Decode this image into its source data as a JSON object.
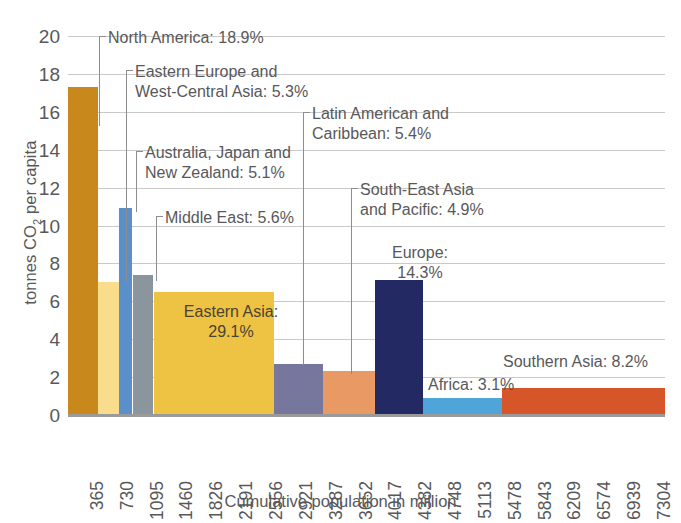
{
  "chart_data": {
    "type": "bar",
    "title": "",
    "subtitle": "",
    "xlabel": "Cumulative population in million",
    "ylabel": "tonnes CO₂ per capita",
    "ylabel_plain": "tonnes CO2 per capita",
    "ylim": [
      0,
      20
    ],
    "ytick_values": [
      0,
      2,
      4,
      6,
      8,
      10,
      12,
      14,
      16,
      18,
      20
    ],
    "ytick_labels": [
      "0",
      "2",
      "4",
      "6",
      "8",
      "10",
      "12",
      "14",
      "16",
      "18",
      "20"
    ],
    "xlim": [
      0,
      7304
    ],
    "xtick_labels": [
      "365",
      "730",
      "1095",
      "1460",
      "1826",
      "2191",
      "2556",
      "2921",
      "3287",
      "3652",
      "4017",
      "4382",
      "4748",
      "5113",
      "5478",
      "5843",
      "6209",
      "6574",
      "6939",
      "7304"
    ],
    "xtick_values": [
      365,
      730,
      1095,
      1460,
      1826,
      2191,
      2556,
      2921,
      3287,
      3652,
      4017,
      4382,
      4748,
      5113,
      5478,
      5843,
      6209,
      6574,
      6939,
      7304
    ],
    "grid": true,
    "grid_axis": "y",
    "legend": "none",
    "bar_width_encodes": "cumulative population share",
    "bar_height_encodes": "tonnes CO2 per capita",
    "regions": [
      {
        "name": "North America",
        "share_label": "North America: 18.9%",
        "share_pct": 18.9,
        "co2_per_capita": 17.3,
        "pop_start": 0,
        "pop_end": 370,
        "color": "#c8881b"
      },
      {
        "name": "Eastern Europe and West-Central Asia",
        "share_label": "Eastern Europe and\nWest-Central Asia: 5.3%",
        "share_pct": 5.3,
        "co2_per_capita": 7.0,
        "pop_start": 370,
        "pop_end": 625,
        "color": "#f9dd8d"
      },
      {
        "name": "Australia, Japan and New Zealand",
        "share_label": "Australia, Japan and\nNew Zealand: 5.1%",
        "share_pct": 5.1,
        "co2_per_capita": 10.9,
        "pop_start": 625,
        "pop_end": 783,
        "color": "#5b8fc9"
      },
      {
        "name": "Middle East",
        "share_label": "Middle East: 5.6%",
        "share_pct": 5.6,
        "co2_per_capita": 7.4,
        "pop_start": 790,
        "pop_end": 1045,
        "color": "#8b959e"
      },
      {
        "name": "Eastern Asia",
        "share_label": "Eastern Asia:\n29.1%",
        "share_pct": 29.1,
        "co2_per_capita": 6.5,
        "pop_start": 1052,
        "pop_end": 2520,
        "color": "#eec243"
      },
      {
        "name": "Latin American and Caribbean",
        "share_label": "Latin American and\nCaribbean: 5.4%",
        "share_pct": 5.4,
        "co2_per_capita": 2.7,
        "pop_start": 2520,
        "pop_end": 3120,
        "color": "#77779e"
      },
      {
        "name": "South-East Asia and Pacific",
        "share_label": "South-East Asia\nand Pacific: 4.9%",
        "share_pct": 4.9,
        "co2_per_capita": 2.3,
        "pop_start": 3120,
        "pop_end": 3760,
        "color": "#e99a64"
      },
      {
        "name": "Europe",
        "share_label": "Europe:\n14.3%",
        "share_pct": 14.3,
        "co2_per_capita": 7.1,
        "pop_start": 3760,
        "pop_end": 4340,
        "color": "#232a63"
      },
      {
        "name": "Africa",
        "share_label": "Africa: 3.1%",
        "share_pct": 3.1,
        "co2_per_capita": 0.9,
        "pop_start": 4340,
        "pop_end": 5310,
        "color": "#4fa5d8"
      },
      {
        "name": "Southern Asia",
        "share_label": "Southern Asia: 8.2%",
        "share_pct": 8.2,
        "co2_per_capita": 1.45,
        "pop_start": 5310,
        "pop_end": 7304,
        "color": "#d6562a"
      }
    ]
  },
  "annotations": {
    "north_america": "North America: 18.9%",
    "eastern_europe": "Eastern Europe and\nWest-Central Asia: 5.3%",
    "australia_japan_nz": "Australia, Japan and\nNew Zealand: 5.1%",
    "middle_east": "Middle East: 5.6%",
    "eastern_asia": "Eastern Asia:\n29.1%",
    "latin_america": "Latin American and\nCaribbean: 5.4%",
    "south_east_asia": "South-East Asia\nand Pacific: 4.9%",
    "europe": "Europe:\n14.3%",
    "africa": "Africa: 3.1%",
    "southern_asia": "Southern Asia: 8.2%"
  },
  "axes": {
    "y_title": "tonnes CO2 per capita",
    "y_title_pre": "tonnes CO",
    "y_title_sub": "2",
    "y_title_post": " per capita",
    "x_title": "Cumulative population in million"
  },
  "colors": {
    "grid": "#c9c9c9",
    "axis": "#9a9a9a",
    "text": "#58585a",
    "in_bar_text": "#4a4334",
    "background": "#ffffff"
  }
}
